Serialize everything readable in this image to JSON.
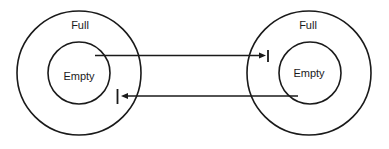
{
  "diagram": {
    "colors": {
      "stroke": "#1a1a1a",
      "background": "#ffffff"
    },
    "nodes": [
      {
        "id": "left",
        "outer_label": "Full",
        "inner_label": "Empty"
      },
      {
        "id": "right",
        "outer_label": "Full",
        "inner_label": "Empty"
      }
    ],
    "edges": [
      {
        "from": "left.inner",
        "to": "right.outer",
        "direction": "left-to-right",
        "end_marker": "arrow-with-bar"
      },
      {
        "from": "right.inner",
        "to": "left.outer",
        "direction": "right-to-left",
        "end_marker": "arrow-with-bar"
      }
    ]
  }
}
